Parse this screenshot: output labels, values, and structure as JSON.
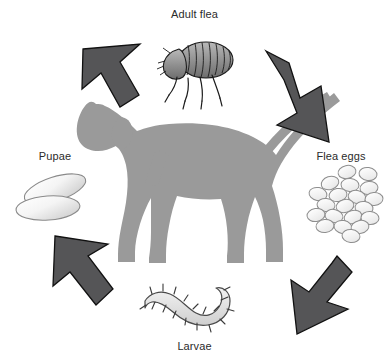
{
  "diagram": {
    "background_color": "#ffffff",
    "stages": [
      {
        "id": "adult-flea",
        "label": "Adult flea",
        "position": "top"
      },
      {
        "id": "flea-eggs",
        "label": "Flea eggs",
        "position": "right"
      },
      {
        "id": "larvae",
        "label": "Larvae",
        "position": "bottom"
      },
      {
        "id": "pupae",
        "label": "Pupae",
        "position": "left"
      }
    ],
    "arrows": [
      {
        "id": "arrow-bottom-left-to-top-left",
        "direction": "up-right",
        "position": "top-left"
      },
      {
        "id": "arrow-top-right-to-right",
        "direction": "down-right",
        "position": "top-right"
      },
      {
        "id": "arrow-bottom-right",
        "direction": "down-left",
        "position": "bottom-right"
      },
      {
        "id": "arrow-bottom-left",
        "direction": "up-left",
        "position": "bottom-left"
      }
    ],
    "center_figure": "dog-silhouette",
    "footer_text": ""
  },
  "colors": {
    "arrow_fill": "#555557",
    "arrow_stroke": "#111111",
    "dog_silhouette": "#9a9a9a",
    "label_text": "#2b2b2b",
    "egg_fill": "#fbfbfb",
    "egg_stroke": "#8e8e8e",
    "pupa_stroke": "#8a8a8a",
    "larva_fill": "#e4e4e4",
    "larva_stroke": "#4a4a4a",
    "flea_body": "#8d8d8d",
    "flea_stroke": "#1b1b1b"
  },
  "counts": {
    "eggs": 20,
    "pupae": 2,
    "larvae": 1,
    "adult_fleas": 1,
    "arrows": 4,
    "dog_legs": 4
  }
}
